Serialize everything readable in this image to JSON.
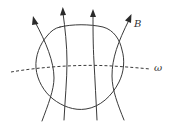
{
  "diagram": {
    "type": "field-lines-through-closed-surface",
    "labels": {
      "field": "B",
      "curve": "ω"
    },
    "elements": {
      "closed_surface": "closed curve region",
      "field_lines_count": 4,
      "field_line_direction": "upward",
      "dashed_curve": "ω crossing the region horizontally"
    },
    "colors": {
      "line": "#3a3a3a",
      "background": "#ffffff"
    }
  }
}
